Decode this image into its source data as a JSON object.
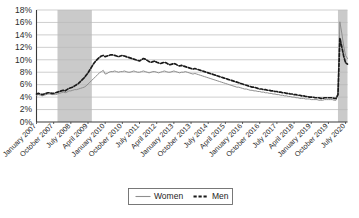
{
  "chart_data": {
    "type": "line",
    "title": "",
    "subtitle": "",
    "xlabel": "",
    "ylabel": "",
    "ylim": [
      0,
      18
    ],
    "ytick_labels": [
      "0%",
      "2%",
      "4%",
      "6%",
      "8%",
      "10%",
      "12%",
      "14%",
      "16%",
      "18%"
    ],
    "ytick_values": [
      0,
      2,
      4,
      6,
      8,
      10,
      12,
      14,
      16,
      18
    ],
    "grid": true,
    "legend_position": "bottom-center",
    "legend_entries": [
      {
        "name": "Women",
        "style": "solid",
        "color": "#8e8e8e"
      },
      {
        "name": "Men",
        "style": "dashed",
        "color": "#1a1a1a"
      }
    ],
    "xtick_labels": [
      "January 2007",
      "October 2007",
      "July 2008",
      "April 2009",
      "January 2010",
      "October 2010",
      "July 2011",
      "April 2012",
      "January 2013",
      "October 2013",
      "July 2014",
      "April 2015",
      "January 2016",
      "October 2016",
      "July 2017",
      "April 2018",
      "January 2019",
      "October 2019",
      "July 2020"
    ],
    "xtick_indices": [
      0,
      9,
      18,
      27,
      36,
      45,
      54,
      63,
      72,
      81,
      90,
      99,
      108,
      117,
      126,
      135,
      144,
      153,
      162
    ],
    "x_start": "January 2007",
    "x_end": "August 2020",
    "x_frequency": "monthly",
    "n_points": 164,
    "annotations": [
      {
        "type": "shaded-band",
        "name": "recession-2007-2009",
        "from_index": 11,
        "to_index": 29,
        "color": "#c3c3c3"
      },
      {
        "type": "shaded-band",
        "name": "recession-2020",
        "from_index": 158,
        "to_index": 164,
        "color": "#c3c3c3"
      }
    ],
    "series": [
      {
        "name": "Women",
        "style": "solid",
        "values": [
          4.3,
          4.4,
          4.3,
          4.2,
          4.3,
          4.4,
          4.5,
          4.5,
          4.4,
          4.4,
          4.4,
          4.5,
          4.6,
          4.7,
          4.8,
          4.7,
          4.8,
          5.0,
          5.0,
          5.1,
          5.2,
          5.2,
          5.3,
          5.4,
          5.5,
          5.6,
          5.8,
          6.1,
          6.4,
          6.7,
          7.0,
          7.3,
          7.6,
          7.9,
          8.1,
          8.3,
          7.7,
          7.8,
          8.0,
          8.1,
          8.1,
          8.2,
          8.1,
          8.0,
          8.1,
          8.1,
          8.2,
          8.1,
          8.0,
          8.0,
          8.1,
          8.2,
          8.1,
          8.0,
          8.0,
          8.1,
          8.2,
          8.1,
          8.0,
          7.9,
          8.0,
          8.1,
          8.1,
          8.0,
          7.9,
          8.0,
          8.1,
          8.2,
          8.1,
          8.0,
          8.0,
          8.1,
          8.2,
          8.1,
          8.0,
          7.9,
          8.0,
          8.0,
          8.1,
          8.0,
          7.9,
          7.8,
          7.7,
          7.8,
          7.7,
          7.6,
          7.5,
          7.4,
          7.3,
          7.2,
          7.1,
          7.0,
          6.9,
          6.8,
          6.7,
          6.6,
          6.5,
          6.4,
          6.3,
          6.2,
          6.1,
          6.0,
          5.9,
          5.8,
          5.7,
          5.6,
          5.6,
          5.5,
          5.4,
          5.3,
          5.3,
          5.2,
          5.1,
          5.1,
          5.0,
          5.0,
          4.9,
          4.9,
          4.8,
          4.8,
          4.7,
          4.7,
          4.6,
          4.6,
          4.5,
          4.5,
          4.4,
          4.4,
          4.3,
          4.3,
          4.2,
          4.2,
          4.1,
          4.1,
          4.0,
          4.0,
          3.9,
          3.9,
          3.8,
          3.8,
          3.8,
          3.7,
          3.7,
          3.7,
          3.6,
          3.6,
          3.6,
          3.6,
          3.5,
          3.5,
          3.5,
          3.6,
          3.6,
          3.6,
          3.6,
          3.6,
          3.5,
          3.5,
          4.4,
          16.1,
          14.3,
          12.2,
          10.7,
          10.2
        ]
      },
      {
        "name": "Men",
        "style": "dashed",
        "values": [
          4.5,
          4.6,
          4.5,
          4.4,
          4.5,
          4.6,
          4.7,
          4.7,
          4.6,
          4.6,
          4.7,
          4.8,
          4.9,
          5.0,
          5.1,
          5.0,
          5.2,
          5.4,
          5.5,
          5.6,
          5.8,
          6.0,
          6.2,
          6.5,
          6.8,
          7.1,
          7.5,
          7.9,
          8.4,
          8.9,
          9.4,
          9.8,
          10.1,
          10.4,
          10.6,
          10.7,
          10.5,
          10.6,
          10.7,
          10.8,
          10.8,
          10.7,
          10.6,
          10.5,
          10.6,
          10.7,
          10.6,
          10.5,
          10.4,
          10.3,
          10.2,
          10.1,
          10.0,
          9.9,
          9.8,
          10.0,
          10.2,
          10.1,
          9.9,
          9.7,
          9.6,
          9.7,
          9.8,
          9.6,
          9.5,
          9.4,
          9.5,
          9.6,
          9.5,
          9.3,
          9.2,
          9.3,
          9.4,
          9.3,
          9.1,
          9.0,
          9.1,
          9.0,
          8.9,
          8.8,
          8.7,
          8.6,
          8.5,
          8.6,
          8.5,
          8.4,
          8.3,
          8.2,
          8.1,
          8.0,
          7.9,
          7.8,
          7.7,
          7.6,
          7.5,
          7.4,
          7.3,
          7.2,
          7.1,
          7.0,
          6.9,
          6.8,
          6.7,
          6.6,
          6.5,
          6.4,
          6.3,
          6.2,
          6.1,
          6.0,
          5.9,
          5.8,
          5.7,
          5.6,
          5.6,
          5.5,
          5.4,
          5.3,
          5.3,
          5.2,
          5.2,
          5.1,
          5.1,
          5.0,
          5.0,
          4.9,
          4.9,
          4.8,
          4.8,
          4.7,
          4.7,
          4.6,
          4.6,
          4.5,
          4.5,
          4.4,
          4.4,
          4.3,
          4.3,
          4.2,
          4.2,
          4.1,
          4.1,
          4.0,
          4.0,
          4.0,
          3.9,
          3.9,
          3.9,
          3.8,
          3.8,
          3.9,
          3.9,
          3.9,
          3.9,
          3.9,
          3.8,
          3.8,
          4.4,
          13.5,
          12.1,
          10.6,
          9.5,
          9.3
        ]
      }
    ]
  }
}
